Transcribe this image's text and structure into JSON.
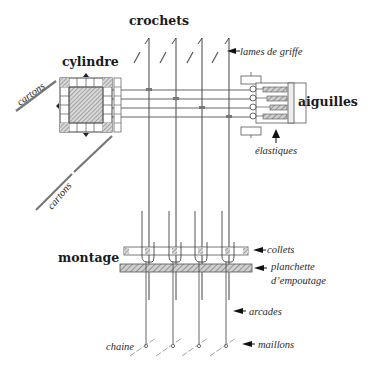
{
  "diagram": {
    "title_labels": {
      "crochets": "crochets",
      "cylindre": "cylindre",
      "aiguilles": "aiguilles",
      "montage": "montage"
    },
    "annotations": {
      "lames_de_griffe": "lames de griffe",
      "elastiques": "élastiques",
      "cartons_top": "cartons",
      "cartons_bottom": "cartons",
      "collets": "collets",
      "planchette_1": "planchette",
      "planchette_2": "d’empoutage",
      "arcades": "arcades",
      "chaine": "chaine",
      "maillons": "maillons"
    },
    "colors": {
      "ink": "#2a2a2a",
      "hatch": "#8a8a8a",
      "background": "#ffffff"
    },
    "hook_count": 4,
    "needle_count": 4
  }
}
